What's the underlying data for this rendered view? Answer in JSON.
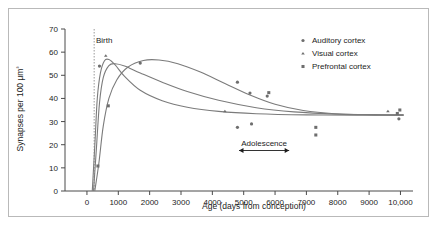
{
  "figure": {
    "background_color": "#ffffff",
    "frame_color": "#b9b9b9",
    "marker_color": "#6e6e6e",
    "curve_color": "#7b7b7b",
    "axis_color": "#4a4a4a"
  },
  "chart_data": {
    "type": "scatter",
    "title": "",
    "xlabel": "Age (days from conception)",
    "ylabel": "Synapses per 100 μm³",
    "xlim": [
      -700,
      10400
    ],
    "ylim": [
      0,
      70
    ],
    "xticks": [
      0,
      1000,
      2000,
      3000,
      4000,
      5000,
      6000,
      7000,
      8000,
      9000,
      10000
    ],
    "xticklabels": [
      "0",
      "1000",
      "2000",
      "3000",
      "4000",
      "5000",
      "6000",
      "7000",
      "8000",
      "9000",
      "10,000"
    ],
    "yticks": [
      0,
      10,
      20,
      30,
      40,
      50,
      60,
      70
    ],
    "yticklabels": [
      "0",
      "10",
      "20",
      "30",
      "40",
      "50",
      "60",
      "70"
    ],
    "grid": false,
    "legend_position": "top-right",
    "series": [
      {
        "name": "Auditory cortex",
        "marker": "circle",
        "points": [
          {
            "x": 400,
            "y": 54.0
          },
          {
            "x": 1700,
            "y": 55.3
          },
          {
            "x": 4800,
            "y": 47.0
          },
          {
            "x": 5200,
            "y": 42.3
          },
          {
            "x": 5750,
            "y": 41.0
          },
          {
            "x": 4800,
            "y": 27.5
          },
          {
            "x": 5250,
            "y": 29.0
          },
          {
            "x": 9950,
            "y": 31.2
          }
        ]
      },
      {
        "name": "Visual cortex",
        "marker": "triangle",
        "points": [
          {
            "x": 600,
            "y": 58.5
          },
          {
            "x": 4400,
            "y": 34.5
          },
          {
            "x": 9600,
            "y": 34.5
          }
        ]
      },
      {
        "name": "Prefrontal cortex",
        "marker": "square",
        "points": [
          {
            "x": 350,
            "y": 10.8
          },
          {
            "x": 680,
            "y": 36.8
          },
          {
            "x": 5800,
            "y": 42.5
          },
          {
            "x": 7300,
            "y": 27.5
          },
          {
            "x": 7300,
            "y": 24.2
          },
          {
            "x": 9980,
            "y": 35.0
          },
          {
            "x": 9900,
            "y": 33.5
          }
        ]
      }
    ],
    "curves": [
      {
        "name": "Visual cortex trend",
        "path": [
          {
            "x": 170,
            "y": 0
          },
          {
            "x": 260,
            "y": 22
          },
          {
            "x": 330,
            "y": 40
          },
          {
            "x": 430,
            "y": 51
          },
          {
            "x": 560,
            "y": 56.3
          },
          {
            "x": 700,
            "y": 56.8
          },
          {
            "x": 900,
            "y": 54.5
          },
          {
            "x": 1200,
            "y": 49.5
          },
          {
            "x": 1700,
            "y": 43.5
          },
          {
            "x": 2400,
            "y": 39.0
          },
          {
            "x": 3200,
            "y": 36.2
          },
          {
            "x": 4200,
            "y": 34.4
          },
          {
            "x": 5400,
            "y": 33.4
          },
          {
            "x": 7000,
            "y": 32.9
          },
          {
            "x": 8600,
            "y": 32.8
          },
          {
            "x": 10100,
            "y": 32.8
          }
        ]
      },
      {
        "name": "Auditory cortex trend",
        "path": [
          {
            "x": 210,
            "y": 0
          },
          {
            "x": 300,
            "y": 18
          },
          {
            "x": 400,
            "y": 38
          },
          {
            "x": 520,
            "y": 49
          },
          {
            "x": 700,
            "y": 54.2
          },
          {
            "x": 900,
            "y": 55.0
          },
          {
            "x": 1200,
            "y": 54.0
          },
          {
            "x": 1700,
            "y": 51.0
          },
          {
            "x": 2400,
            "y": 47.0
          },
          {
            "x": 3200,
            "y": 43.0
          },
          {
            "x": 4200,
            "y": 39.2
          },
          {
            "x": 5400,
            "y": 36.0
          },
          {
            "x": 6600,
            "y": 34.2
          },
          {
            "x": 8000,
            "y": 33.2
          },
          {
            "x": 9200,
            "y": 32.9
          },
          {
            "x": 10100,
            "y": 32.8
          }
        ]
      },
      {
        "name": "Prefrontal cortex trend",
        "path": [
          {
            "x": 250,
            "y": 0
          },
          {
            "x": 380,
            "y": 12
          },
          {
            "x": 520,
            "y": 28
          },
          {
            "x": 700,
            "y": 40
          },
          {
            "x": 950,
            "y": 48
          },
          {
            "x": 1300,
            "y": 53.5
          },
          {
            "x": 1800,
            "y": 56.4
          },
          {
            "x": 2300,
            "y": 56.6
          },
          {
            "x": 2900,
            "y": 55.0
          },
          {
            "x": 3600,
            "y": 51.5
          },
          {
            "x": 4400,
            "y": 46.5
          },
          {
            "x": 5200,
            "y": 41.5
          },
          {
            "x": 6000,
            "y": 37.5
          },
          {
            "x": 6900,
            "y": 34.8
          },
          {
            "x": 7900,
            "y": 33.4
          },
          {
            "x": 9000,
            "y": 33.0
          },
          {
            "x": 10100,
            "y": 32.9
          }
        ]
      }
    ],
    "annotations": [
      {
        "name": "birth",
        "label": "Birth",
        "x": 230,
        "type": "vertical-dashed-line"
      },
      {
        "name": "adolescence",
        "label": "Adolescence",
        "x_start": 4850,
        "x_end": 6450,
        "y": 17.5,
        "type": "double-arrow"
      }
    ]
  },
  "legend": {
    "items": [
      {
        "label": "Auditory cortex",
        "marker": "circle"
      },
      {
        "label": "Visual cortex",
        "marker": "triangle"
      },
      {
        "label": "Prefrontal cortex",
        "marker": "square"
      }
    ]
  }
}
